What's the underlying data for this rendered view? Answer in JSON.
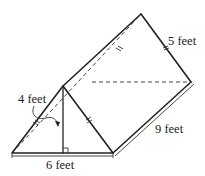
{
  "figure": {
    "type": "triangular prism",
    "labels": {
      "height": "4 feet",
      "slant_side": "5 feet",
      "base": "6 feet",
      "length": "9 feet"
    },
    "markers": {
      "right_angle": true,
      "congruent_sides_ticks": true
    }
  }
}
